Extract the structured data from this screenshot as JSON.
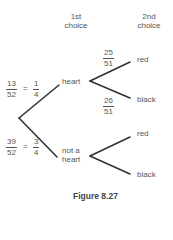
{
  "headers": {
    "first": [
      "1st",
      "choice"
    ],
    "second": [
      "2nd",
      "choice"
    ]
  },
  "root_branches": [
    {
      "label": "heart",
      "prob": {
        "num": "13",
        "den": "52",
        "eq": "=",
        "simp_num": "1",
        "simp_den": "4"
      },
      "children": [
        {
          "label": "red",
          "prob": {
            "num": "25",
            "den": "51"
          }
        },
        {
          "label": "black",
          "prob": {
            "num": "26",
            "den": "51"
          }
        }
      ]
    },
    {
      "label": [
        "not a",
        "heart"
      ],
      "prob": {
        "num": "39",
        "den": "52",
        "eq": "=",
        "simp_num": "3",
        "simp_den": "4"
      },
      "children": [
        {
          "label": "red"
        },
        {
          "label": "black"
        }
      ]
    }
  ],
  "caption": "Figure 8.27",
  "colors": {
    "line": "#333333",
    "text": "#555555"
  }
}
